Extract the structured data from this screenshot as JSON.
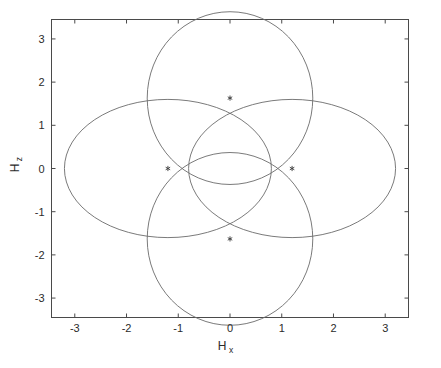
{
  "chart_data": {
    "type": "scatter",
    "title": "",
    "subtitle": "",
    "xlabel": "H",
    "xlabel_sub": "x",
    "ylabel": "H",
    "ylabel_sub": "z",
    "xlim": [
      -3.45,
      3.45
    ],
    "ylim": [
      -3.45,
      3.45
    ],
    "xticks": [
      -3,
      -2,
      -1,
      0,
      1,
      2,
      3
    ],
    "xticklabels": [
      "-3",
      "-2",
      "-1",
      "0",
      "1",
      "2",
      "3"
    ],
    "yticks": [
      -3,
      -2,
      -1,
      0,
      1,
      2,
      3
    ],
    "yticklabels": [
      "-3",
      "-2",
      "-1",
      "0",
      "1",
      "2",
      "3"
    ],
    "grid": false,
    "legend": null,
    "frame": true,
    "series": [
      {
        "name": "ellipse-upper",
        "type": "ellipse",
        "center": [
          0.0,
          1.63
        ],
        "semi_major_x": 2.0,
        "semi_major_y": 1.6,
        "orientation": "vertical-pair"
      },
      {
        "name": "ellipse-lower",
        "type": "ellipse",
        "center": [
          0.0,
          -1.63
        ],
        "semi_major_x": 2.0,
        "semi_major_y": 1.6,
        "orientation": "vertical-pair"
      },
      {
        "name": "ellipse-left",
        "type": "ellipse",
        "center": [
          -1.2,
          0.0
        ],
        "semi_major_x": 2.0,
        "semi_major_y": 1.6,
        "orientation": "horizontal-pair"
      },
      {
        "name": "ellipse-right",
        "type": "ellipse",
        "center": [
          1.2,
          0.0
        ],
        "semi_major_x": 2.0,
        "semi_major_y": 1.6,
        "orientation": "horizontal-pair"
      }
    ],
    "markers": {
      "symbol": "asterisk",
      "x": [
        0.0,
        0.0,
        -1.2,
        1.2
      ],
      "y": [
        1.63,
        -1.63,
        0.0,
        0.0
      ],
      "labels": [
        "center-upper",
        "center-lower",
        "center-left",
        "center-right"
      ]
    },
    "colors": {
      "curve": "#6b6b6b",
      "axis": "#4a4a4a",
      "text": "#2b2b2b",
      "marker": "#3a3a3a",
      "background": "#ffffff"
    }
  }
}
